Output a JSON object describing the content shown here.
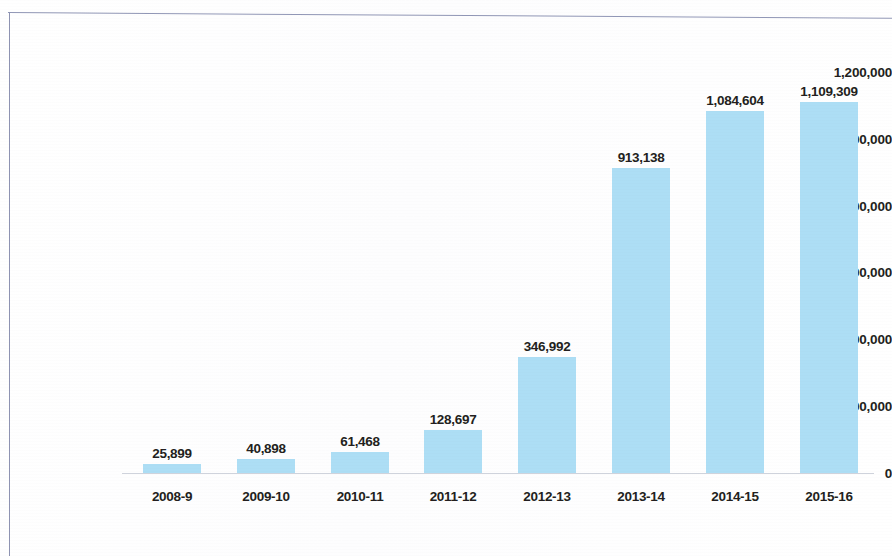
{
  "chart_data": {
    "type": "bar",
    "title": "",
    "subtitle": "",
    "xlabel": "",
    "ylabel": "",
    "categories": [
      "2008-9",
      "2009-10",
      "2010-11",
      "2011-12",
      "2012-13",
      "2013-14",
      "2014-15",
      "2015-16"
    ],
    "values": [
      25899,
      40898,
      61468,
      128697,
      346992,
      913138,
      1084604,
      1109309
    ],
    "value_labels": [
      "25,899",
      "40,898",
      "61,468",
      "128,697",
      "346,992",
      "913,138",
      "1,084,604",
      "1,109,309"
    ],
    "ylim": [
      0,
      1200000
    ],
    "y_ticks": [
      0,
      200000,
      400000,
      600000,
      800000,
      1000000,
      1200000
    ],
    "y_tick_labels": [
      "0",
      "200,000",
      "400,000",
      "600,000",
      "800,000",
      "1,000,000",
      "1,200,000"
    ],
    "grid": false,
    "legend": null,
    "legend_position": "none",
    "series": [
      {
        "name": "",
        "values": [
          25899,
          40898,
          61468,
          128697,
          346992,
          913138,
          1084604,
          1109309
        ]
      }
    ],
    "colors": {
      "bar_fill": "#addef5",
      "data_label_text": "#231f20",
      "axis_label_text": "#231f20",
      "axis_line": "#cfd3dc",
      "frame_rule": "#8e93b2",
      "background": "#fefefe"
    }
  }
}
